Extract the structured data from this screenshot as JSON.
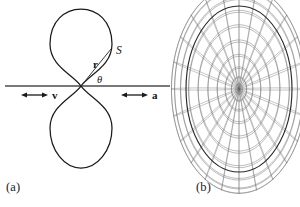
{
  "figure": {
    "background_color": "#ffffff",
    "width": 300,
    "height": 207,
    "stroke_color": "#1a1a1a",
    "mesh_color": "#6a6a6a"
  },
  "panels": [
    {
      "id": "a",
      "label": "(a)",
      "caption_position": {
        "x": 6,
        "y": 180
      },
      "description": "polar radiation pattern with two symmetric teardrop lobes"
    },
    {
      "id": "b",
      "label": "(b)",
      "caption_position": {
        "x": 196,
        "y": 180
      },
      "description": "three dimensional wireframe torus rendering of the same pattern"
    }
  ],
  "panel_a": {
    "axis": {
      "name": "horizontal-axis",
      "x_start": 5,
      "x_end": 170,
      "y": 86
    },
    "origin": {
      "x": 81,
      "y": 86
    },
    "lobes": [
      {
        "name": "upper-lobe",
        "direction": "up",
        "tip_y": 10
      },
      {
        "name": "lower-lobe",
        "direction": "down",
        "tip_y": 168
      }
    ],
    "annotations": [
      {
        "name": "point-label-S",
        "text": "S",
        "style": "italic",
        "x": 116,
        "y": 51
      },
      {
        "name": "vector-label-r",
        "text": "r",
        "style": "bold",
        "x": 95,
        "y": 66
      },
      {
        "name": "angle-label-theta",
        "text": "θ",
        "style": "italic",
        "x": 99,
        "y": 82
      }
    ],
    "radius_line": {
      "from": {
        "x": 81,
        "y": 86
      },
      "to": {
        "x": 111,
        "y": 48
      }
    },
    "arrows": [
      {
        "name": "velocity-arrow",
        "label": "v",
        "style": "bold",
        "double_headed": true,
        "x_start": 22,
        "x_end": 46,
        "y": 95,
        "label_x": 52,
        "label_y": 99
      },
      {
        "name": "acceleration-arrow",
        "label": "a",
        "style": "bold",
        "double_headed": true,
        "x_start": 122,
        "x_end": 146,
        "y": 95,
        "label_x": 152,
        "label_y": 99
      }
    ]
  },
  "chart_data": {
    "type": "line",
    "title": "",
    "subtitle": "",
    "xlabel": "",
    "ylabel": "",
    "plots": [
      {
        "name": "dipole-radiation-pattern-2d",
        "panel": "a",
        "coordinate_system": "polar",
        "function": "sin^2(theta) lobes (teardrop), symmetric about horizontal axis",
        "lobe_count": 2,
        "lobe_axis": "vertical",
        "pinch_point_label": "origin",
        "annotations": [
          "S",
          "r",
          "θ",
          "v",
          "a"
        ],
        "grid": false,
        "legend": null
      },
      {
        "name": "dipole-radiation-pattern-3d",
        "panel": "b",
        "coordinate_system": "3d-wireframe",
        "surface": "torus of revolution of the sin^2(theta) lobes about the v/a axis",
        "mesh_u_lines": 24,
        "mesh_v_lines": 24,
        "view": "nearly face-on, slight tilt, hole collapsed to central point",
        "grid": true,
        "legend": null,
        "bounds": {
          "x_min": 186,
          "x_max": 292,
          "y_min": 6,
          "y_max": 172
        }
      }
    ]
  }
}
